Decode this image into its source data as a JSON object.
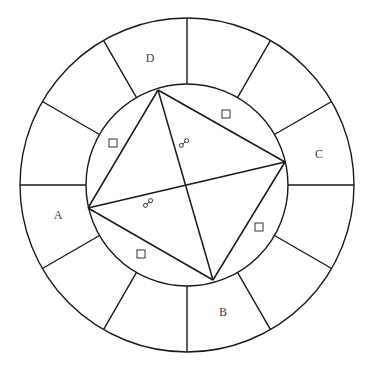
{
  "diagram": {
    "type": "astrological-chart-wheel",
    "center": [
      187,
      185
    ],
    "outer_radius": 167,
    "inner_radius": 101,
    "spoke_count": 12,
    "spoke_angle_step_deg": 30,
    "line_color": "#1a1a1a",
    "labels": [
      {
        "text": "D",
        "x": 150,
        "y": 58
      },
      {
        "text": "C",
        "x": 319,
        "y": 154
      },
      {
        "text": "A",
        "x": 58,
        "y": 215
      },
      {
        "text": "B",
        "x": 223,
        "y": 312
      }
    ],
    "vertices": {
      "top": [
        158,
        90
      ],
      "right": [
        285,
        162
      ],
      "bottom": [
        213,
        280
      ],
      "left": [
        88,
        208
      ]
    },
    "aspect_lines": [
      {
        "from": "top",
        "to": "right",
        "aspect": "square"
      },
      {
        "from": "right",
        "to": "bottom",
        "aspect": "square"
      },
      {
        "from": "bottom",
        "to": "left",
        "aspect": "square"
      },
      {
        "from": "left",
        "to": "top",
        "aspect": "square"
      },
      {
        "from": "top",
        "to": "bottom",
        "aspect": "opposition"
      },
      {
        "from": "left",
        "to": "right",
        "aspect": "opposition"
      }
    ],
    "square_symbols": [
      {
        "x": 113,
        "y": 143
      },
      {
        "x": 226,
        "y": 114
      },
      {
        "x": 259,
        "y": 227
      },
      {
        "x": 141,
        "y": 254
      }
    ],
    "opposition_symbols": [
      {
        "x": 184,
        "y": 143
      },
      {
        "x": 148,
        "y": 203
      }
    ]
  }
}
